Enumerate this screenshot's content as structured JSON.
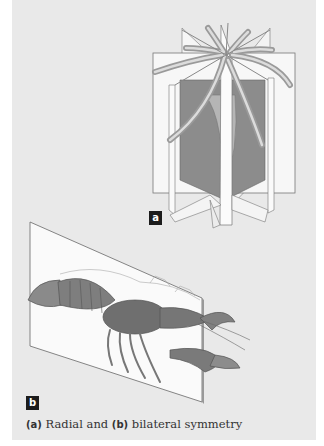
{
  "figure": {
    "panel_a_label": "a",
    "panel_b_label": "b",
    "panel_a_subject": "sea anemone with radial symmetry planes",
    "panel_b_subject": "crayfish with bilateral symmetry plane"
  },
  "caption": {
    "label_a": "(a)",
    "text_a": " Radial and ",
    "label_b": "(b)",
    "text_b": " bilateral symmetry"
  },
  "colors": {
    "background": "#e9e9e9",
    "badge": "#1c1c1c",
    "plane": "#f7f7f7",
    "body_dark": "#7a7a7a"
  }
}
